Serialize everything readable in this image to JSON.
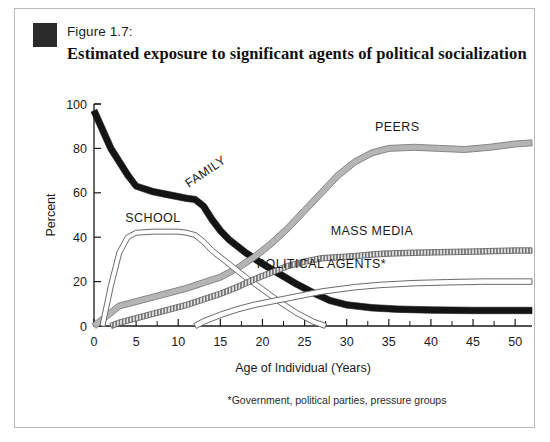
{
  "figure": {
    "number": "Figure 1.7:",
    "title": "Estimated exposure to significant agents of political socialization",
    "footnote": "*Government, political parties, pressure groups"
  },
  "chart_data": {
    "type": "line",
    "title": "Estimated exposure to significant agents of political socialization",
    "xlabel": "Age of Individual  (Years)",
    "ylabel": "Percent",
    "xlim": [
      0,
      52
    ],
    "ylim": [
      0,
      100
    ],
    "xticks": [
      0,
      5,
      10,
      15,
      20,
      25,
      30,
      35,
      40,
      45,
      50
    ],
    "yticks": [
      0,
      20,
      40,
      60,
      80,
      100
    ],
    "grid": false,
    "legend_position": "inline-labels",
    "series": [
      {
        "name": "FAMILY",
        "style": "thick-black-band",
        "color": "#141414",
        "band_width": 6.5,
        "label_x": 13.5,
        "label_y": 68,
        "label_rotate": -34,
        "x": [
          0,
          2,
          4,
          5,
          7,
          9,
          11,
          12,
          13,
          14,
          15,
          16,
          18,
          20,
          22,
          24,
          26,
          28,
          30,
          33,
          36,
          40,
          45,
          50,
          52
        ],
        "y": [
          97,
          80,
          68,
          63,
          60.5,
          59,
          57.5,
          57,
          54,
          48,
          43,
          39,
          33,
          28,
          23.5,
          19,
          15,
          11.5,
          9.5,
          8.2,
          7.6,
          7.2,
          7,
          7,
          7
        ]
      },
      {
        "name": "PEERS",
        "style": "gray-band",
        "color": "#b5b5b5",
        "band_width": 6,
        "label_x": 36,
        "label_y": 88,
        "label_rotate": 0,
        "x": [
          0,
          1,
          3,
          5,
          7,
          9,
          11,
          13,
          15,
          17,
          19,
          21,
          23,
          25,
          27,
          29,
          31,
          33,
          35,
          38,
          41,
          44,
          47,
          50,
          52
        ],
        "y": [
          0,
          3,
          9,
          11,
          13,
          15,
          17,
          19.5,
          22,
          26,
          31,
          37,
          44,
          52,
          60,
          68,
          74,
          78,
          80,
          80.5,
          80,
          79.5,
          80.5,
          82,
          82.5
        ]
      },
      {
        "name": "SCHOOL",
        "style": "outline-band",
        "color": "#ffffff",
        "band_width": 5,
        "label_x": 7,
        "label_y": 47,
        "label_rotate": 0,
        "x": [
          1,
          2,
          3,
          4,
          5,
          7,
          9,
          10,
          11,
          12,
          13,
          14,
          16,
          18,
          20,
          22,
          24,
          26,
          27.5
        ],
        "y": [
          0,
          18,
          33,
          40,
          42,
          42.5,
          42.5,
          42.5,
          42,
          41,
          38,
          34,
          28,
          22,
          16.5,
          11,
          6,
          2,
          0
        ]
      },
      {
        "name": "MASS MEDIA",
        "style": "hatched-band",
        "color": "#cfcfcf",
        "band_width": 5.5,
        "label_x": 33,
        "label_y": 41,
        "label_rotate": 0,
        "x": [
          2,
          3,
          5,
          7,
          9,
          11,
          13,
          15,
          17,
          19,
          21,
          23,
          25,
          27,
          29,
          31,
          34,
          38,
          42,
          46,
          50,
          52
        ],
        "y": [
          0,
          1.5,
          3.5,
          5.5,
          7.5,
          9.5,
          12,
          14.5,
          17.5,
          21,
          24,
          27,
          29,
          30.5,
          31,
          31.5,
          32.5,
          33,
          33.3,
          33.6,
          34,
          34
        ]
      },
      {
        "name": "POLITICAL AGENTS*",
        "style": "outline-band",
        "color": "#ffffff",
        "band_width": 5.5,
        "label_x": 27,
        "label_y": 26,
        "label_rotate": 0,
        "x": [
          12,
          13,
          15,
          17,
          19,
          21,
          23,
          25,
          27,
          29,
          31,
          34,
          38,
          42,
          46,
          50,
          52
        ],
        "y": [
          0,
          2,
          5,
          7.5,
          9.5,
          11,
          12.5,
          14,
          15.5,
          16.5,
          17.5,
          18.5,
          19.3,
          19.7,
          20,
          20,
          20
        ]
      }
    ]
  }
}
